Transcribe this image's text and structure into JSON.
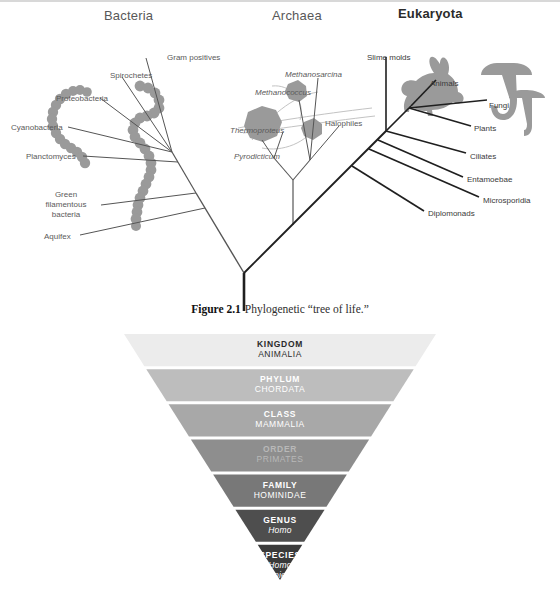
{
  "figure": {
    "caption_number": "Figure 2.1",
    "caption_text": "Phylogenetic “tree of life.”",
    "domains": [
      {
        "label": "Bacteria",
        "bold": false,
        "x": 104,
        "y": 8
      },
      {
        "label": "Archaea",
        "bold": false,
        "x": 272,
        "y": 8
      },
      {
        "label": "Eukaryota",
        "bold": true,
        "x": 398,
        "y": 6
      }
    ],
    "bacteria_labels": [
      {
        "text": "Gram positives",
        "x": 167,
        "y": 53,
        "italic": false,
        "align": "left"
      },
      {
        "text": "Spirochetes",
        "x": 110,
        "y": 71,
        "italic": false,
        "align": "left"
      },
      {
        "text": "Proteobacteria",
        "x": 56,
        "y": 94,
        "italic": false,
        "align": "left"
      },
      {
        "text": "Cyanobacteria",
        "x": 11,
        "y": 123,
        "italic": false,
        "align": "left"
      },
      {
        "text": "Planctomyces",
        "x": 26,
        "y": 152,
        "italic": false,
        "align": "left"
      },
      {
        "text": "Green\nfilamentous\nbacteria",
        "x": 58,
        "y": 190,
        "italic": false,
        "align": "center"
      },
      {
        "text": "Aquifex",
        "x": 44,
        "y": 232,
        "italic": false,
        "align": "left"
      }
    ],
    "archaea_labels": [
      {
        "text": "Methanosarcina",
        "x": 285,
        "y": 70,
        "italic": true,
        "align": "left"
      },
      {
        "text": "Methanococcus",
        "x": 255,
        "y": 88,
        "italic": true,
        "align": "left"
      },
      {
        "text": "Halophiles",
        "x": 325,
        "y": 119,
        "italic": false,
        "align": "left"
      },
      {
        "text": "Thermoproteus",
        "x": 230,
        "y": 126,
        "italic": true,
        "align": "left"
      },
      {
        "text": "Pyrodicticum",
        "x": 234,
        "y": 152,
        "italic": true,
        "align": "left"
      }
    ],
    "eukaryota_labels": [
      {
        "text": "Slime molds",
        "x": 367,
        "y": 53,
        "italic": false,
        "align": "left"
      },
      {
        "text": "Animals",
        "x": 430,
        "y": 79,
        "italic": false,
        "align": "left"
      },
      {
        "text": "Fungi",
        "x": 489,
        "y": 101,
        "italic": false,
        "align": "left"
      },
      {
        "text": "Plants",
        "x": 474,
        "y": 124,
        "italic": false,
        "align": "left"
      },
      {
        "text": "Ciliates",
        "x": 470,
        "y": 152,
        "italic": false,
        "align": "left"
      },
      {
        "text": "Entamoebae",
        "x": 467,
        "y": 175,
        "italic": false,
        "align": "left"
      },
      {
        "text": "Microsporidia",
        "x": 483,
        "y": 196,
        "italic": false,
        "align": "left"
      },
      {
        "text": "Diplomonads",
        "x": 428,
        "y": 209,
        "italic": false,
        "align": "left"
      }
    ],
    "colors": {
      "organism_fill": "#9a9a9a",
      "branch_line": "#3a3a3a",
      "thin_line": "#6e6e6e",
      "faint_line": "#bdbdbd",
      "label_text": "#5a5a5a"
    }
  },
  "pyramid": {
    "levels": [
      {
        "rank": "KINGDOM",
        "taxon": "ANIMALIA",
        "taxon_italic": false,
        "fill": "#ececec",
        "text_color": "#2a2a2a"
      },
      {
        "rank": "PHYLUM",
        "taxon": "CHORDATA",
        "taxon_italic": false,
        "fill": "#bdbdbd",
        "text_color": "#ffffff"
      },
      {
        "rank": "CLASS",
        "taxon": "MAMMALIA",
        "taxon_italic": false,
        "fill": "#a8a8a8",
        "text_color": "#ffffff"
      },
      {
        "rank": "ORDER",
        "taxon": "PRIMATES",
        "taxon_italic": false,
        "fill": "#8e8e8e",
        "text_color": "#b8b8b8"
      },
      {
        "rank": "FAMILY",
        "taxon": "HOMINIDAE",
        "taxon_italic": false,
        "fill": "#787878",
        "text_color": "#ffffff"
      },
      {
        "rank": "GENUS",
        "taxon": "Homo",
        "taxon_italic": true,
        "fill": "#4e4e4e",
        "text_color": "#ffffff"
      },
      {
        "rank": "SPECIES",
        "taxon": "Homo\nsapiens",
        "taxon_italic": true,
        "fill": "#3a3a3a",
        "text_color": "#ffffff"
      }
    ]
  }
}
